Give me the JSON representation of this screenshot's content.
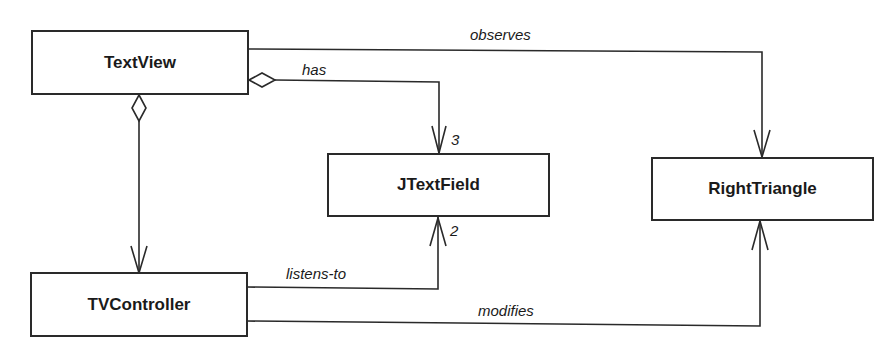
{
  "diagram": {
    "type": "uml-class-diagram",
    "classes": [
      {
        "id": "textview",
        "name": "TextView"
      },
      {
        "id": "jtextfield",
        "name": "JTextField"
      },
      {
        "id": "righttriangle",
        "name": "RightTriangle"
      },
      {
        "id": "tvcontroller",
        "name": "TVController"
      }
    ],
    "relationships": [
      {
        "from": "TextView",
        "to": "RightTriangle",
        "label": "observes",
        "kind": "association"
      },
      {
        "from": "TextView",
        "to": "JTextField",
        "label": "has",
        "kind": "aggregation",
        "multiplicity": "3"
      },
      {
        "from": "TextView",
        "to": "TVController",
        "label": "",
        "kind": "aggregation"
      },
      {
        "from": "TVController",
        "to": "JTextField",
        "label": "listens-to",
        "kind": "association",
        "multiplicity": "2"
      },
      {
        "from": "TVController",
        "to": "RightTriangle",
        "label": "modifies",
        "kind": "association"
      }
    ],
    "labels": {
      "observes": "observes",
      "has": "has",
      "listens_to": "listens-to",
      "modifies": "modifies",
      "mult_has": "3",
      "mult_listens": "2"
    },
    "colors": {
      "line": "#2a2a2a",
      "background": "#ffffff"
    }
  }
}
